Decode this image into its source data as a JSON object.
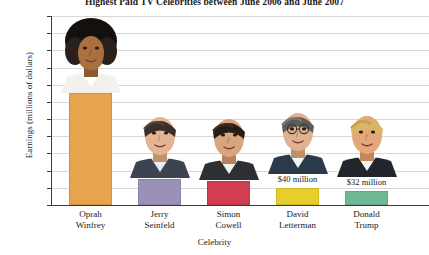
{
  "chart_data": {
    "type": "bar",
    "title": "Highest Paid TV Celebrities between June 2006 and June 2007",
    "xlabel": "Celebrity",
    "ylabel": "Earnings (millions of dollars)",
    "categories": [
      "Oprah Winfrey",
      "Jerry Seinfeld",
      "Simon Cowell",
      "David Letterman",
      "Donald Trump"
    ],
    "category_lines": [
      [
        "Oprah",
        "Winfrey"
      ],
      [
        "Jerry",
        "Seinfeld"
      ],
      [
        "Simon",
        "Cowell"
      ],
      [
        "David",
        "Letterman"
      ],
      [
        "Donald",
        "Trump"
      ]
    ],
    "values": [
      260,
      60,
      55,
      40,
      32
    ],
    "data_labels": [
      "",
      "",
      "",
      "$40 million",
      "$32 million"
    ],
    "colors": [
      "#E8A34E",
      "#9B91B8",
      "#D23E51",
      "#E8CE2B",
      "#6FB894"
    ],
    "ylim": [
      0,
      440
    ],
    "ytick_step": 40,
    "yticks": [
      0,
      40,
      80,
      120,
      160,
      200,
      240,
      280,
      320,
      360,
      400,
      440
    ],
    "grid": true,
    "legend": "none"
  }
}
